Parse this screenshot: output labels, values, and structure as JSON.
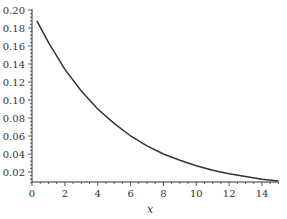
{
  "chart_data": {
    "type": "line",
    "title": "",
    "xlabel": "x",
    "ylabel": "",
    "xlim": [
      0,
      15
    ],
    "ylim": [
      0.005,
      0.2
    ],
    "grid": false,
    "legend": null,
    "x_ticks": [
      0,
      2,
      4,
      6,
      8,
      10,
      12,
      14
    ],
    "x_tick_labels": [
      "0",
      "2",
      "4",
      "6",
      "8",
      "10",
      "12",
      "14"
    ],
    "y_ticks": [
      0.02,
      0.04,
      0.06,
      0.08,
      0.1,
      0.12,
      0.14,
      0.16,
      0.18,
      0.2
    ],
    "y_tick_labels": [
      "0.02",
      "0.04",
      "0.06",
      "0.08",
      "0.10",
      "0.12",
      "0.14",
      "0.16",
      "0.18",
      "0.20"
    ],
    "series": [
      {
        "name": "f(x)",
        "color": "#333333",
        "x": [
          0.3,
          1,
          2,
          3,
          4,
          5,
          6,
          7,
          8,
          9,
          10,
          11,
          12,
          13,
          14,
          15
        ],
        "values": [
          0.188,
          0.164,
          0.134,
          0.11,
          0.09,
          0.074,
          0.06,
          0.049,
          0.04,
          0.033,
          0.027,
          0.022,
          0.018,
          0.015,
          0.012,
          0.01
        ]
      }
    ]
  }
}
